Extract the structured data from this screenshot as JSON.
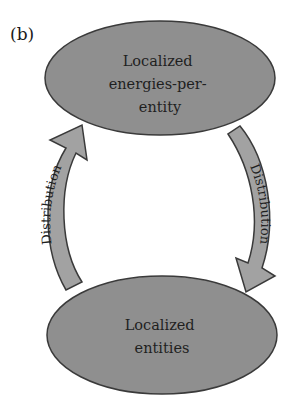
{
  "panel_label": "(b)",
  "nodes": [
    {
      "id": "top",
      "lines": [
        "Localized",
        "energies-per-",
        "entity"
      ]
    },
    {
      "id": "bottom",
      "lines": [
        "Localized",
        "entities"
      ]
    }
  ],
  "edges": [
    {
      "from": "bottom",
      "to": "top",
      "side": "left",
      "label": "Distribution"
    },
    {
      "from": "top",
      "to": "bottom",
      "side": "right",
      "label": "Distribution"
    }
  ],
  "colors": {
    "node_fill": "#8f8f8f",
    "node_stroke": "#3a3a3a",
    "arrow_fill": "#a2a2a2",
    "arrow_stroke": "#3a3a3a",
    "text": "#1f1f1f"
  }
}
